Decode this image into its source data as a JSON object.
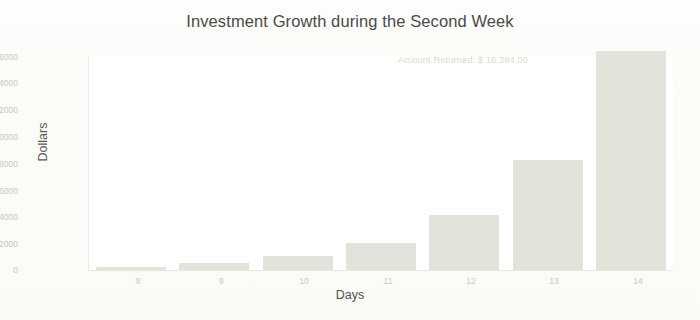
{
  "chart_data": {
    "type": "bar",
    "title": "Investment Growth during the Second Week",
    "xlabel": "Days",
    "ylabel": "Dollars",
    "categories": [
      "8",
      "9",
      "10",
      "11",
      "12",
      "13",
      "14"
    ],
    "values": [
      256,
      512,
      1024,
      2048,
      4096,
      8192,
      16384
    ],
    "series": [
      {
        "name": "Investment Value",
        "values": [
          256,
          512,
          1024,
          2048,
          4096,
          8192,
          16384
        ]
      }
    ],
    "ylim": [
      0,
      16000
    ],
    "yticks": [
      "0",
      "2000",
      "4000",
      "6000",
      "8000",
      "10000",
      "12000",
      "14000",
      "16000"
    ],
    "xticks": [
      "8",
      "9",
      "10",
      "11",
      "12",
      "13",
      "14"
    ],
    "grid": false,
    "legend": false,
    "annotations": [
      {
        "text": "Amount Returned: $ 16,384.00",
        "position": "top-right"
      }
    ],
    "colors": {
      "bar_fill": "#e3e3dc",
      "title_text": "#4a4a4a",
      "axis_label_text": "#4f4f4f",
      "tick_text": "#c9c9bd",
      "annotation_text": "#dcdcd2",
      "plot_background": "#ffffff",
      "figure_background": "#fbfbf7"
    }
  }
}
